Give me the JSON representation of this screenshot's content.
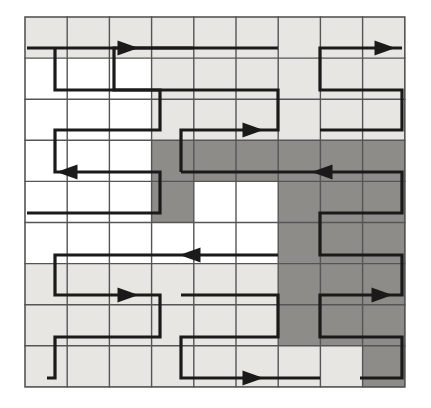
{
  "figure": {
    "kind": "diagram",
    "width": 431,
    "height": 408,
    "background_color": "#ffffff"
  },
  "grid": {
    "columns": 9,
    "rows": 9,
    "x0": 25,
    "y0": 17,
    "cell_width": 42.2,
    "cell_height": 41.1,
    "line_color": "#555555",
    "line_width": 1.4,
    "border_color": "#555555",
    "border_width": 1.6
  },
  "legend": {
    "fill_white_label": "free space",
    "fill_light_label": "light shaded region",
    "fill_dark_label": "dark shaded region",
    "white_color": "#ffffff",
    "light_color": "#e8e6e2",
    "dark_color": "#8e8c89"
  },
  "shading": {
    "note": "Per-row fill codes. 0 = white, 1 = light gray, 2 = dark gray. Nine values per row, one per column.",
    "rows": [
      [
        1,
        1,
        1,
        1,
        1,
        1,
        1,
        1,
        1
      ],
      [
        0,
        0,
        0,
        1,
        1,
        1,
        1,
        1,
        1
      ],
      [
        0,
        0,
        0,
        1,
        1,
        1,
        1,
        1,
        1
      ],
      [
        0,
        0,
        0,
        2,
        2,
        2,
        2,
        2,
        2
      ],
      [
        0,
        0,
        0,
        2,
        0,
        0,
        2,
        2,
        2
      ],
      [
        0,
        0,
        0,
        0,
        0,
        0,
        2,
        2,
        2
      ],
      [
        1,
        1,
        1,
        1,
        1,
        1,
        2,
        2,
        2
      ],
      [
        1,
        1,
        1,
        1,
        1,
        1,
        2,
        2,
        2
      ],
      [
        1,
        1,
        1,
        1,
        1,
        1,
        1,
        1,
        2
      ]
    ]
  },
  "path": {
    "stroke_color": "#1a1a1a",
    "stroke_width": 3.2,
    "arrow_color": "#1a1a1a",
    "segment_count": 5,
    "segments": [
      {
        "name": "left-region-sweep",
        "description": "Boustrophedon sweep covering the white column block at the left, rows 0 through 4.",
        "points": "27,48 193,48 55,48 55,90 160,90 160,130 55,130 55,172 160,172 160,213 27,213"
      },
      {
        "name": "left-lower-region-sweep",
        "description": "Boustrophedon sweep covering the lower left light shaded block, rows 5 through 8.",
        "points": "55,255 278,255 55,255 55,295 160,295 160,337 55,337 55,378 47,378"
      },
      {
        "name": "upper-middle-region-sweep",
        "description": "Boustrophedon sweep covering the upper middle light shaded block, rows 0 through 2.",
        "points": "278,48 114,48 114,90 278,90 278,130 181,130 181,172"
      },
      {
        "name": "upper-right-region-sweep",
        "description": "Boustrophedon sweep covering the upper right light shaded block, rows 0 through 2.",
        "points": "402,48 320,48 320,90 402,90 402,130 320,130"
      },
      {
        "name": "right-dark-region-sweep",
        "description": "Boustrophedon sweep covering the dark shaded block at the right, rows 3 through 8.",
        "points": "181,172 402,172 402,213 320,213 320,255 402,255 402,295 320,295 320,337 402,337 402,378 360,378"
      },
      {
        "name": "bottom-middle-region-sweep",
        "description": "Boustrophedon sweep covering the bottom middle light shaded block, rows 6 through 8.",
        "points": "181,295 278,295 278,337 181,337 181,378 320,378"
      }
    ]
  },
  "arrows": [
    {
      "name": "arrow-top-left",
      "x": 128,
      "y": 48,
      "direction": "right"
    },
    {
      "name": "arrow-top-right",
      "x": 385,
      "y": 48,
      "direction": "right"
    },
    {
      "name": "arrow-row2-middle",
      "x": 253,
      "y": 130,
      "direction": "right"
    },
    {
      "name": "arrow-row3-dark",
      "x": 322,
      "y": 172,
      "direction": "left"
    },
    {
      "name": "arrow-row4-left",
      "x": 67,
      "y": 172,
      "direction": "left"
    },
    {
      "name": "arrow-row5-middle",
      "x": 190,
      "y": 255,
      "direction": "left"
    },
    {
      "name": "arrow-row6-left",
      "x": 128,
      "y": 295,
      "direction": "right"
    },
    {
      "name": "arrow-row6-dark",
      "x": 382,
      "y": 295,
      "direction": "right"
    },
    {
      "name": "arrow-bottom-middle",
      "x": 253,
      "y": 378,
      "direction": "right"
    }
  ]
}
